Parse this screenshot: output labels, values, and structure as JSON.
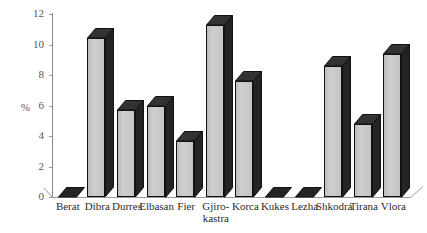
{
  "chart_data": {
    "type": "bar",
    "title": "",
    "xlabel": "",
    "ylabel": "%",
    "ylim": [
      0,
      12
    ],
    "ytick_values": [
      0,
      2,
      4,
      6,
      8,
      10,
      12
    ],
    "ytick_labels": [
      "0",
      "2",
      "4",
      "6",
      "8",
      "10",
      "12"
    ],
    "grid": false,
    "legend": "none",
    "style": "3d-column",
    "categories": [
      "Berat",
      "Dibra",
      "Durres",
      "Elbasan",
      "Fier",
      "Gjiro-kastra",
      "Korca",
      "Kukes",
      "Lezha",
      "Shkodra",
      "Tirana",
      "Vlora"
    ],
    "category_labels": [
      {
        "line1": "Berat",
        "line2": ""
      },
      {
        "line1": "Dibra",
        "line2": ""
      },
      {
        "line1": "Durres",
        "line2": ""
      },
      {
        "line1": "Elbasan",
        "line2": ""
      },
      {
        "line1": "Fier",
        "line2": ""
      },
      {
        "line1": "Gjiro-",
        "line2": "kastra"
      },
      {
        "line1": "Korca",
        "line2": ""
      },
      {
        "line1": "Kukes",
        "line2": ""
      },
      {
        "line1": "Lezha",
        "line2": ""
      },
      {
        "line1": "Shkodra",
        "line2": ""
      },
      {
        "line1": "Tirana",
        "line2": ""
      },
      {
        "line1": "Vlora",
        "line2": ""
      }
    ],
    "values": [
      0,
      10.4,
      5.7,
      6.0,
      3.7,
      11.3,
      7.6,
      0,
      0,
      8.6,
      4.8,
      9.4
    ],
    "colors": {
      "bar_front": "#c6c6c6",
      "bar_side": "#242424",
      "bar_top": "#333333",
      "bar_outline": "#111111",
      "axis": "#8a8a8a",
      "text": "#2a2a2a",
      "tick_text": "#555555",
      "background": "#ffffff"
    }
  }
}
